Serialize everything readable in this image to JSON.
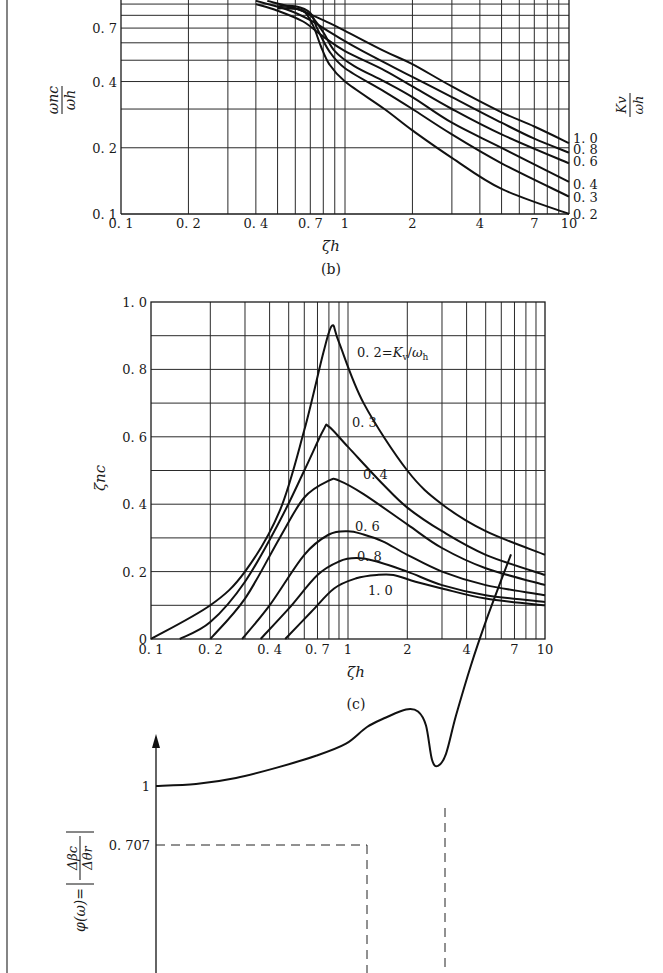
{
  "chart_data": [
    {
      "id": "b",
      "type": "line",
      "caption": "(b)",
      "xscale": "log",
      "yscale": "log",
      "xlabel": "ζh",
      "ylabel": "ωnc/ωh",
      "right_label": "Kv/ωh",
      "xlim": [
        0.1,
        10
      ],
      "ylim": [
        0.1,
        0.9
      ],
      "xticks": [
        "0.1",
        "0.2",
        "0.4",
        "0.7",
        "1",
        "2",
        "4",
        "7",
        "10"
      ],
      "xtick_values": [
        0.1,
        0.2,
        0.4,
        0.7,
        1,
        2,
        4,
        7,
        10
      ],
      "yticks": [
        "0.1",
        "0.2",
        "0.4",
        "0.7"
      ],
      "ytick_values": [
        0.1,
        0.2,
        0.4,
        0.7
      ],
      "grid": true,
      "series": [
        {
          "name": "1.0",
          "label": "1.0",
          "x": [
            0.45,
            0.6,
            0.8,
            1,
            1.5,
            2,
            3,
            5,
            7,
            10
          ],
          "y": [
            0.93,
            0.86,
            0.76,
            0.68,
            0.55,
            0.48,
            0.38,
            0.29,
            0.25,
            0.21
          ]
        },
        {
          "name": "0.8",
          "label": "0.8",
          "x": [
            0.4,
            0.55,
            0.7,
            0.9,
            1.2,
            2,
            3,
            5,
            7,
            10
          ],
          "y": [
            0.93,
            0.85,
            0.76,
            0.65,
            0.55,
            0.42,
            0.34,
            0.26,
            0.22,
            0.19
          ]
        },
        {
          "name": "0.6",
          "label": "0.6",
          "x": [
            0.4,
            0.5,
            0.65,
            0.8,
            1,
            1.5,
            2,
            3,
            5,
            10
          ],
          "y": [
            0.9,
            0.84,
            0.75,
            0.64,
            0.55,
            0.45,
            0.38,
            0.3,
            0.23,
            0.17
          ]
        },
        {
          "name": "0.4",
          "label": "0.4",
          "x": [
            0.5,
            0.6,
            0.7,
            0.8,
            0.9,
            1.1,
            1.5,
            2,
            3,
            5,
            10
          ],
          "y": [
            0.86,
            0.86,
            0.8,
            0.67,
            0.55,
            0.47,
            0.4,
            0.34,
            0.26,
            0.2,
            0.14
          ]
        },
        {
          "name": "0.3",
          "label": "0.3",
          "x": [
            0.5,
            0.6,
            0.7,
            0.75,
            0.85,
            1,
            1.5,
            2,
            3,
            5,
            10
          ],
          "y": [
            0.88,
            0.88,
            0.82,
            0.7,
            0.55,
            0.46,
            0.36,
            0.3,
            0.23,
            0.17,
            0.12
          ]
        },
        {
          "name": "0.2",
          "label": "0.2",
          "x": [
            0.55,
            0.65,
            0.72,
            0.78,
            0.85,
            1,
            1.5,
            2,
            3,
            5,
            10
          ],
          "y": [
            0.86,
            0.84,
            0.72,
            0.58,
            0.48,
            0.4,
            0.3,
            0.24,
            0.18,
            0.13,
            0.1
          ]
        }
      ]
    },
    {
      "id": "c",
      "type": "line",
      "caption": "(c)",
      "xscale": "log",
      "yscale": "linear",
      "xlabel": "ζh",
      "ylabel": "ζnc",
      "xlim": [
        0.1,
        10
      ],
      "ylim": [
        0,
        1.0
      ],
      "xticks": [
        "0.1",
        "0.2",
        "0.4",
        "0.7",
        "1",
        "2",
        "4",
        "7",
        "10"
      ],
      "xtick_values": [
        0.1,
        0.2,
        0.4,
        0.7,
        1,
        2,
        4,
        7,
        10
      ],
      "yticks": [
        "0",
        "0.2",
        "0.4",
        "0.6",
        "0.8",
        "1.0"
      ],
      "ytick_values": [
        0,
        0.2,
        0.4,
        0.6,
        0.8,
        1.0
      ],
      "grid": true,
      "series": [
        {
          "name": "0.2",
          "label": "0.2=Kv/ωh",
          "x": [
            0.1,
            0.2,
            0.3,
            0.45,
            0.6,
            0.75,
            0.83,
            0.9,
            1.2,
            2,
            3,
            5,
            10
          ],
          "y": [
            0,
            0.1,
            0.2,
            0.38,
            0.62,
            0.85,
            0.93,
            0.88,
            0.7,
            0.5,
            0.4,
            0.32,
            0.25
          ]
        },
        {
          "name": "0.3",
          "label": "0.3",
          "x": [
            0.14,
            0.2,
            0.3,
            0.45,
            0.6,
            0.75,
            0.8,
            1,
            1.5,
            2,
            3,
            5,
            10
          ],
          "y": [
            0,
            0.05,
            0.17,
            0.35,
            0.5,
            0.62,
            0.63,
            0.57,
            0.46,
            0.39,
            0.32,
            0.25,
            0.19
          ]
        },
        {
          "name": "0.4",
          "label": "0.4",
          "x": [
            0.2,
            0.3,
            0.45,
            0.6,
            0.8,
            0.9,
            1.2,
            2,
            3,
            5,
            10
          ],
          "y": [
            0,
            0.12,
            0.3,
            0.42,
            0.47,
            0.47,
            0.43,
            0.34,
            0.27,
            0.21,
            0.16
          ]
        },
        {
          "name": "0.6",
          "label": "0.6",
          "x": [
            0.29,
            0.4,
            0.6,
            0.8,
            1,
            1.2,
            1.5,
            2,
            3,
            5,
            10
          ],
          "y": [
            0,
            0.1,
            0.25,
            0.31,
            0.32,
            0.31,
            0.29,
            0.25,
            0.2,
            0.16,
            0.13
          ]
        },
        {
          "name": "0.8",
          "label": "0.8",
          "x": [
            0.36,
            0.5,
            0.7,
            0.9,
            1.1,
            1.4,
            2,
            3,
            5,
            10
          ],
          "y": [
            0,
            0.09,
            0.19,
            0.23,
            0.24,
            0.23,
            0.2,
            0.16,
            0.13,
            0.11
          ]
        },
        {
          "name": "1.0",
          "label": "1.0",
          "x": [
            0.48,
            0.65,
            0.85,
            1.1,
            1.4,
            1.7,
            2.2,
            3,
            5,
            10
          ],
          "y": [
            0,
            0.08,
            0.15,
            0.18,
            0.19,
            0.19,
            0.17,
            0.15,
            0.12,
            0.1
          ]
        }
      ]
    },
    {
      "id": "d",
      "type": "line",
      "caption": "",
      "xscale": "linear",
      "yscale": "linear",
      "xlabel": "ω",
      "ylabel": "φ(ω)=|Δβc/Δθr|",
      "yticks": [
        "1",
        "0.707"
      ],
      "ytick_values": [
        1,
        0.707
      ],
      "grid": false,
      "annotations": [
        "dashed line at 0.707 to bandwidth frequency",
        "dashed line at resonant peak frequency"
      ],
      "series": [
        {
          "name": "phi",
          "x": [
            0,
            40,
            80,
            120,
            160,
            190,
            211,
            230,
            250,
            262,
            270,
            276,
            282,
            290,
            300,
            315,
            330,
            345,
            355
          ],
          "y": [
            1,
            0.99,
            0.96,
            0.91,
            0.85,
            0.79,
            0.707,
            0.66,
            0.62,
            0.63,
            0.7,
            0.87,
            0.9,
            0.84,
            0.65,
            0.4,
            0.18,
            -0.02,
            -0.15
          ]
        }
      ]
    }
  ],
  "figure": {
    "caption_b": "(b)",
    "caption_c": "(c)",
    "tick_0707": "0.707",
    "tick_1": "1"
  }
}
